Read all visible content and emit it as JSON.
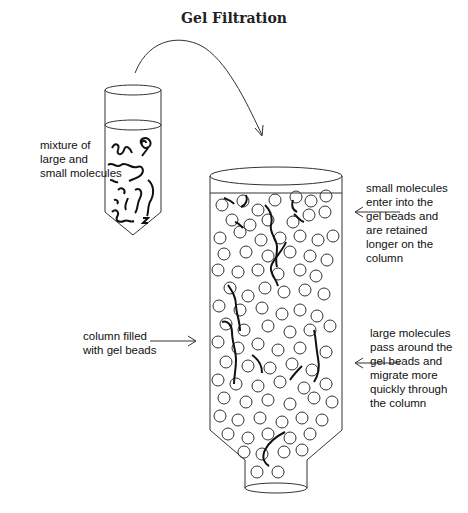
{
  "title": "Gel Filtration",
  "labels": {
    "mixture": "mixture of\nlarge and\nsmall molecules",
    "small_molecules": "small molecules\nenter into the\ngel beads and\nare retained\nlonger on the\ncolumn",
    "column_filled": "column filled\nwith gel beads",
    "large_molecules": "large molecules\npass around the\ngel beads and\nmigrate more\nquickly through\nthe column"
  },
  "icons": {
    "transfer_arrow": "curved-arrow",
    "tube": "test-tube",
    "column": "chromatography-column"
  },
  "colors": {
    "ink": "#222222",
    "background": "#ffffff"
  }
}
